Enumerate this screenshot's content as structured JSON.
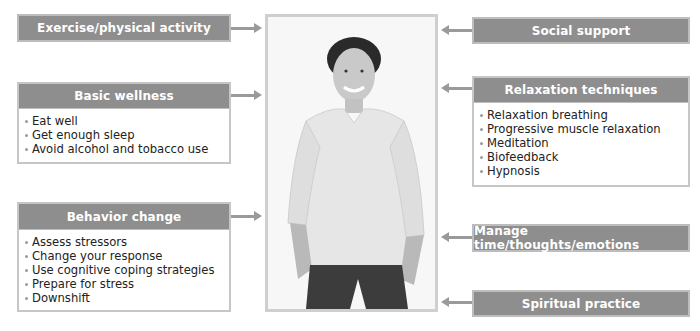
{
  "center_image": {
    "description": "Smiling young man in light long-sleeve v-neck shirt and dark jeans, hands in pockets",
    "icon": "person-photo"
  },
  "left": {
    "exercise": {
      "title": "Exercise/physical activity"
    },
    "basic_wellness": {
      "title": "Basic wellness",
      "items": [
        "Eat well",
        "Get enough sleep",
        "Avoid alcohol and tobacco use"
      ]
    },
    "behavior_change": {
      "title": "Behavior change",
      "items": [
        "Assess stressors",
        "Change your response",
        "Use cognitive coping strategies",
        "Prepare for stress",
        "Downshift"
      ]
    }
  },
  "right": {
    "social_support": {
      "title": "Social support"
    },
    "relaxation": {
      "title": "Relaxation techniques",
      "items": [
        "Relaxation breathing",
        "Progressive muscle relaxation",
        "Meditation",
        "Biofeedback",
        "Hypnosis"
      ]
    },
    "manage": {
      "title": "Manage time/thoughts/emotions"
    },
    "spiritual": {
      "title": "Spiritual practice"
    }
  },
  "colors": {
    "header_bg": "#8e8e8e",
    "header_border": "#bdbdbd",
    "arrow": "#9a9a9a",
    "frame": "#cfcfcf"
  }
}
